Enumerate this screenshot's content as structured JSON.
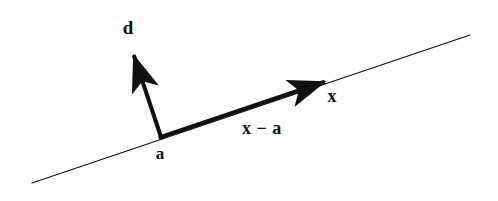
{
  "figure": {
    "background_color": "#fefefe",
    "stroke_color": "#101010",
    "labels": {
      "direction_vector": "d",
      "base_point": "a",
      "point_x": "x",
      "difference_vector": "x − a"
    }
  },
  "chart_data": {
    "type": "diagram",
    "background_color": "#fefefe",
    "stroke_color": "#101010",
    "elements": [
      {
        "name": "infinite-line",
        "kind": "line",
        "style": "thin",
        "stroke_width": 1.1,
        "from": [
          32,
          183
        ],
        "to": [
          470,
          35
        ]
      },
      {
        "name": "direction-vector-d",
        "kind": "arrow",
        "style": "thick",
        "stroke_width": 4.0,
        "from": [
          161,
          137
        ],
        "to": [
          131,
          47
        ],
        "label": "d",
        "label_position": [
          128,
          27
        ]
      },
      {
        "name": "difference-vector-x-minus-a",
        "kind": "arrow",
        "style": "thick",
        "stroke_width": 4.0,
        "from": [
          161,
          137
        ],
        "to": [
          333,
          79
        ],
        "label": "x − a",
        "label_position": [
          262,
          128
        ]
      },
      {
        "name": "base-point-a",
        "kind": "point-label",
        "position": [
          161,
          137
        ],
        "label": "a",
        "label_position": [
          160,
          153
        ]
      },
      {
        "name": "point-x",
        "kind": "point-label",
        "position": [
          333,
          79
        ],
        "label": "x",
        "label_position": [
          332,
          96
        ]
      }
    ]
  }
}
